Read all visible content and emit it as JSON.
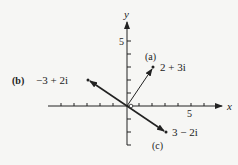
{
  "diagram": {
    "type": "complex-plane-vectors",
    "axes": {
      "x_label": "x",
      "y_label": "y",
      "x_tick_label": "5",
      "y_tick_label": "5",
      "x_range": [
        -6,
        7
      ],
      "y_range": [
        -3,
        6
      ]
    },
    "vectors": [
      {
        "tag": "(a)",
        "label": "2 + 3i",
        "re": 2,
        "im": 3
      },
      {
        "tag": "(b)",
        "label": "−3 + 2i",
        "re": -3,
        "im": 2
      },
      {
        "tag": "(c)",
        "label": "3 − 2i",
        "re": 3,
        "im": -2
      }
    ],
    "colors": {
      "ink": "#222222",
      "background": "#f6f6f4"
    }
  }
}
